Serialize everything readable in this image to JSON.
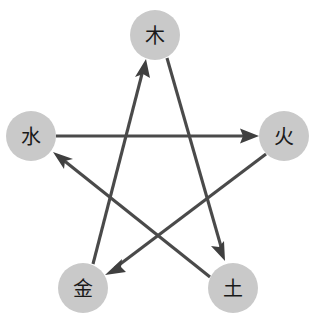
{
  "diagram": {
    "canvas": {
      "width": 311,
      "height": 313,
      "background": "#ffffff"
    },
    "colors": {
      "node_fill": "#c9c9c9",
      "node_text": "#1a1a1a",
      "edge": "#4a4a4a",
      "arrow": "#3f3f3f"
    },
    "nodes": [
      {
        "id": "wood",
        "label": "木",
        "cx": 155,
        "cy": 35,
        "r": 25
      },
      {
        "id": "fire",
        "label": "火",
        "cx": 284,
        "cy": 136,
        "r": 25
      },
      {
        "id": "earth",
        "label": "土",
        "cx": 233,
        "cy": 288,
        "r": 25
      },
      {
        "id": "metal",
        "label": "金",
        "cx": 83,
        "cy": 288,
        "r": 25
      },
      {
        "id": "water",
        "label": "水",
        "cx": 31,
        "cy": 136,
        "r": 25
      }
    ],
    "edges": [
      {
        "id": "water-to-fire",
        "from": "water",
        "to": "fire",
        "from_label": "水",
        "to_label": "火"
      },
      {
        "id": "fire-to-metal",
        "from": "fire",
        "to": "metal",
        "from_label": "火",
        "to_label": "金"
      },
      {
        "id": "metal-to-wood",
        "from": "metal",
        "to": "wood",
        "from_label": "金",
        "to_label": "木"
      },
      {
        "id": "wood-to-earth",
        "from": "wood",
        "to": "earth",
        "from_label": "木",
        "to_label": "土"
      },
      {
        "id": "earth-to-water",
        "from": "earth",
        "to": "water",
        "from_label": "土",
        "to_label": "水"
      }
    ]
  }
}
